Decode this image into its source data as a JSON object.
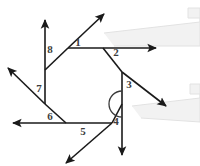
{
  "figure": {
    "background_color": "#ffffff",
    "line_color": "#1a1a1a",
    "label_color": "#3d3d3d",
    "callout_fill": "#f2f2f2",
    "callout_stroke": "#e2e2e2",
    "width": 200,
    "height": 166
  },
  "labels": {
    "one": "1",
    "two": "2",
    "three": "3",
    "four": "4",
    "five": "5",
    "six": "6",
    "seven": "7",
    "eight": "8"
  },
  "geometry": {
    "polygon_vertices": [
      {
        "name": "top-left",
        "x": 68,
        "y": 48
      },
      {
        "name": "top-right",
        "x": 103,
        "y": 48
      },
      {
        "name": "right-upper",
        "x": 122,
        "y": 72
      },
      {
        "name": "right-lower",
        "x": 122,
        "y": 104
      },
      {
        "name": "bottom-right",
        "x": 112,
        "y": 123
      },
      {
        "name": "bottom-left",
        "x": 66,
        "y": 123
      },
      {
        "name": "left-lower",
        "x": 45,
        "y": 104
      },
      {
        "name": "left-upper",
        "x": 45,
        "y": 70
      }
    ],
    "rays": [
      {
        "name": "ray-1-up-right",
        "from_x": 68,
        "from_y": 48,
        "to_x": 104,
        "to_y": 14
      },
      {
        "name": "ray-2-right",
        "from_x": 103,
        "from_y": 48,
        "to_x": 156,
        "to_y": 48
      },
      {
        "name": "ray-3-down-right",
        "from_x": 122,
        "from_y": 72,
        "to_x": 166,
        "to_y": 106
      },
      {
        "name": "ray-4-down",
        "from_x": 122,
        "from_y": 104,
        "to_x": 122,
        "to_y": 155
      },
      {
        "name": "ray-5-down-left",
        "from_x": 112,
        "from_y": 123,
        "to_x": 66,
        "to_y": 163
      },
      {
        "name": "ray-6-left",
        "from_x": 66,
        "from_y": 123,
        "to_x": 13,
        "to_y": 123
      },
      {
        "name": "ray-7-up-left",
        "from_x": 45,
        "from_y": 104,
        "to_x": 8,
        "to_y": 68
      },
      {
        "name": "ray-8-up",
        "from_x": 45,
        "from_y": 70,
        "to_x": 45,
        "to_y": 20
      }
    ],
    "angle_markers": [
      {
        "name": "reflex-arc-at-vertex-4",
        "center_x": 122,
        "center_y": 104,
        "radius": 13
      }
    ]
  },
  "label_positions": [
    {
      "key": "one",
      "x": 78,
      "y": 43
    },
    {
      "key": "two",
      "x": 116,
      "y": 53
    },
    {
      "key": "three",
      "x": 129,
      "y": 85
    },
    {
      "key": "four",
      "x": 116,
      "y": 122
    },
    {
      "key": "five",
      "x": 83,
      "y": 132
    },
    {
      "key": "six",
      "x": 50,
      "y": 117
    },
    {
      "key": "seven",
      "x": 39,
      "y": 89
    },
    {
      "key": "eight",
      "x": 50,
      "y": 50
    }
  ],
  "callouts": [
    {
      "name": "callout-upper-right",
      "points": "104,33 200,22 200,8 188,8 188,18 200,18 200,46 114,46"
    },
    {
      "name": "callout-lower-right",
      "points": "132,106 200,98 200,84 190,84 190,94 200,94 200,122 141,118"
    }
  ]
}
